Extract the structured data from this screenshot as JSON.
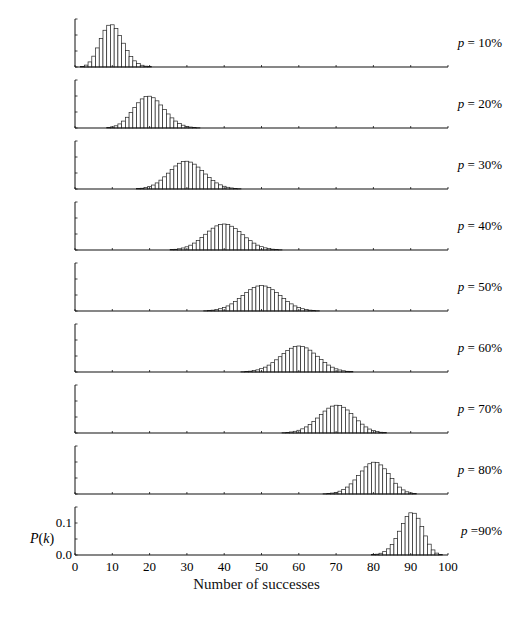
{
  "chart_data": {
    "type": "bar",
    "title": "",
    "n": 100,
    "xlabel": "Number of successes",
    "ylabel": "P(k)",
    "xlim": [
      0,
      100
    ],
    "ylim": [
      0,
      0.15
    ],
    "x_ticks": [
      0,
      10,
      20,
      30,
      40,
      50,
      60,
      70,
      80,
      90,
      100
    ],
    "y_ticks": [
      0.0,
      0.1
    ],
    "y_tick_labels": [
      "0.0",
      "0.1"
    ],
    "grid": false,
    "panels": [
      {
        "label": "p = 10%",
        "p": 0.1,
        "peak_k": 10,
        "peak_value": 0.132
      },
      {
        "label": "p = 20%",
        "p": 0.2,
        "peak_k": 20,
        "peak_value": 0.099
      },
      {
        "label": "p = 30%",
        "p": 0.3,
        "peak_k": 30,
        "peak_value": 0.087
      },
      {
        "label": "p = 40%",
        "p": 0.4,
        "peak_k": 40,
        "peak_value": 0.081
      },
      {
        "label": "p = 50%",
        "p": 0.5,
        "peak_k": 50,
        "peak_value": 0.08
      },
      {
        "label": "p = 60%",
        "p": 0.6,
        "peak_k": 60,
        "peak_value": 0.081
      },
      {
        "label": "p = 70%",
        "p": 0.7,
        "peak_k": 70,
        "peak_value": 0.087
      },
      {
        "label": "p = 80%",
        "p": 0.8,
        "peak_k": 80,
        "peak_value": 0.099
      },
      {
        "label": "p =90%",
        "p": 0.9,
        "peak_k": 90,
        "peak_value": 0.132
      }
    ]
  }
}
